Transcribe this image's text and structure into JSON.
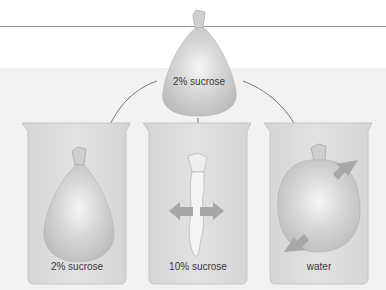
{
  "diagram": {
    "type": "osmosis-beakers",
    "source_bag": {
      "label": "2% sucrose"
    },
    "beakers": [
      {
        "solution_label": "2% sucrose",
        "bag_state": "unchanged",
        "net_water_flow": "none"
      },
      {
        "solution_label": "10% sucrose",
        "bag_state": "shriveled",
        "net_water_flow": "out of bag"
      },
      {
        "solution_label": "water",
        "bag_state": "swollen",
        "net_water_flow": "into bag"
      }
    ],
    "colors": {
      "background": "#ffffff",
      "panel": "#f2f2f2",
      "beaker": "#dcdcdc",
      "bag": "#c8c8c8",
      "arrow": "#9c9c9c",
      "line": "#555555"
    }
  }
}
